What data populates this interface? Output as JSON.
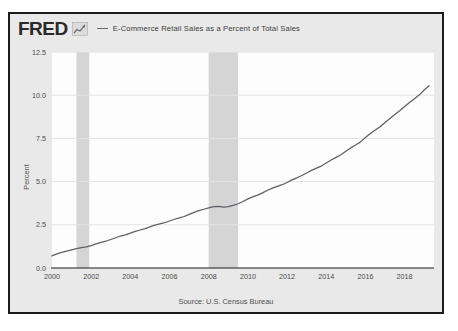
{
  "card": {
    "background_color": "#e9e9e9",
    "border_color": "#1b1b1b"
  },
  "header": {
    "logo_text": "FRED",
    "logo_mark_icon": "line-chart-icon",
    "legend_dash_icon": "legend-line-icon",
    "legend_label": "E-Commerce Retail Sales as a Percent of Total Sales"
  },
  "footer": {
    "source_note": "Source: U.S. Census Bureau"
  },
  "chart_data": {
    "type": "line",
    "title": "E-Commerce Retail Sales as a Percent of Total Sales",
    "xlabel": "",
    "ylabel": "Percent",
    "ylim": [
      0.0,
      12.5
    ],
    "xlim": [
      2000,
      2019.5
    ],
    "grid": true,
    "legend_position": "top",
    "series_color": "#5e5e66",
    "recession_band_color": "#d5d5d5",
    "ytick_labels": [
      "12.5",
      "10.0",
      "7.5",
      "5.0",
      "2.5",
      "0.0"
    ],
    "ytick_values": [
      12.5,
      10.0,
      7.5,
      5.0,
      2.5,
      0.0
    ],
    "xtick_labels": [
      "2000",
      "2002",
      "2004",
      "2006",
      "2008",
      "2010",
      "2012",
      "2014",
      "2016",
      "2018"
    ],
    "xtick_values": [
      2000,
      2002,
      2004,
      2006,
      2008,
      2010,
      2012,
      2014,
      2016,
      2018
    ],
    "recession_bands": [
      {
        "start": 2001.25,
        "end": 2001.9,
        "label": "2001 recession"
      },
      {
        "start": 2008.0,
        "end": 2009.5,
        "label": "2008-2009 recession"
      }
    ],
    "series": [
      {
        "name": "E-Commerce Retail Sales as a Percent of Total Sales",
        "x": [
          2000.0,
          2000.25,
          2000.5,
          2000.75,
          2001.0,
          2001.25,
          2001.5,
          2001.75,
          2002.0,
          2002.25,
          2002.5,
          2002.75,
          2003.0,
          2003.25,
          2003.5,
          2003.75,
          2004.0,
          2004.25,
          2004.5,
          2004.75,
          2005.0,
          2005.25,
          2005.5,
          2005.75,
          2006.0,
          2006.25,
          2006.5,
          2006.75,
          2007.0,
          2007.25,
          2007.5,
          2007.75,
          2008.0,
          2008.25,
          2008.5,
          2008.75,
          2009.0,
          2009.25,
          2009.5,
          2009.75,
          2010.0,
          2010.25,
          2010.5,
          2010.75,
          2011.0,
          2011.25,
          2011.5,
          2011.75,
          2012.0,
          2012.25,
          2012.5,
          2012.75,
          2013.0,
          2013.25,
          2013.5,
          2013.75,
          2014.0,
          2014.25,
          2014.5,
          2014.75,
          2015.0,
          2015.25,
          2015.5,
          2015.75,
          2016.0,
          2016.25,
          2016.5,
          2016.75,
          2017.0,
          2017.25,
          2017.5,
          2017.75,
          2018.0,
          2018.25,
          2018.5,
          2018.75,
          2019.0,
          2019.25
        ],
        "values": [
          0.7,
          0.82,
          0.9,
          0.98,
          1.05,
          1.12,
          1.18,
          1.22,
          1.3,
          1.4,
          1.48,
          1.55,
          1.65,
          1.75,
          1.85,
          1.92,
          2.02,
          2.12,
          2.2,
          2.28,
          2.38,
          2.48,
          2.55,
          2.62,
          2.72,
          2.82,
          2.9,
          2.98,
          3.1,
          3.22,
          3.32,
          3.4,
          3.48,
          3.55,
          3.56,
          3.52,
          3.55,
          3.62,
          3.72,
          3.85,
          4.0,
          4.12,
          4.22,
          4.35,
          4.5,
          4.62,
          4.72,
          4.82,
          4.95,
          5.1,
          5.22,
          5.35,
          5.5,
          5.65,
          5.78,
          5.9,
          6.08,
          6.25,
          6.4,
          6.55,
          6.75,
          6.95,
          7.12,
          7.3,
          7.55,
          7.78,
          7.98,
          8.18,
          8.42,
          8.65,
          8.88,
          9.1,
          9.35,
          9.58,
          9.8,
          10.02,
          10.3,
          10.55
        ]
      }
    ]
  }
}
